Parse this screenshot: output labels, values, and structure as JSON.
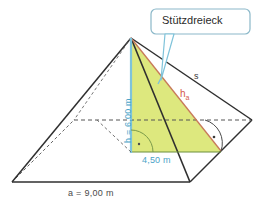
{
  "figure": {
    "title_callout": "Stützdreieck",
    "labels": {
      "base": "a = 9,00 m",
      "height": "h = 6,00 m",
      "height_symbol": "h",
      "height_sub": "",
      "half_base": "4,50 m",
      "slant_edge": "s",
      "face_height": "h",
      "face_height_sub": "a"
    },
    "colors": {
      "triangle_fill": "#dde87e",
      "outline": "#2f2f2f",
      "height_blue": "#4aa3c7",
      "face_height_red": "#d4584a",
      "callout_border": "#8bb8c9",
      "callout_tail": "#7fc3da",
      "arc_green": "#7a9a4a",
      "dashed": "#555555",
      "background": "#ffffff"
    },
    "geometry": {
      "apex": [
        131,
        38
      ],
      "base_front_left": [
        12,
        182
      ],
      "base_front_right": [
        190,
        182
      ],
      "base_back_right": [
        252,
        120
      ],
      "base_back_left": [
        74,
        120
      ],
      "base_center": [
        131,
        152
      ],
      "foot_half": [
        190,
        152
      ]
    },
    "angle_markers": [
      {
        "name": "right-angle-at-center",
        "x": 131,
        "y": 152
      },
      {
        "name": "right-angle-at-edge",
        "x": 221,
        "y": 137
      }
    ]
  }
}
